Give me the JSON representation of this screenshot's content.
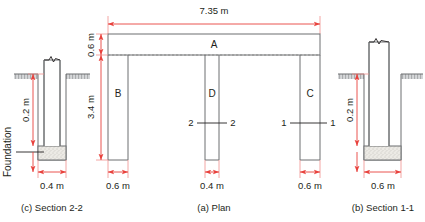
{
  "figure": {
    "colors": {
      "dimension": "#e8413c",
      "outline": "#6d6e71",
      "text": "#231f20",
      "ground_hatch": "#b8babc",
      "footing_fill": "#e9e8e4"
    }
  },
  "plan": {
    "caption": "(a) Plan",
    "overall_span_label": "7.35 m",
    "beam_depth_label": "0.6 m",
    "column_height_label": "3.4 m",
    "members": {
      "beam": "A",
      "column_left": "B",
      "column_middle": "D",
      "column_right": "C"
    },
    "column_widths": [
      {
        "member": "B",
        "label": "0.6 m"
      },
      {
        "member": "D",
        "label": "0.4 m"
      },
      {
        "member": "C",
        "label": "0.6 m"
      }
    ],
    "section_marks": [
      {
        "id": "2",
        "left_label": "2",
        "right_label": "2",
        "on_member": "D"
      },
      {
        "id": "1",
        "left_label": "1",
        "right_label": "1",
        "on_member": "C"
      }
    ]
  },
  "section_1_1": {
    "caption": "(b) Section 1-1",
    "depth_label": "0.2 m",
    "width_label": "0.6 m"
  },
  "section_2_2": {
    "caption": "(c) Section 2-2",
    "depth_label": "0.2 m",
    "width_label": "0.4 m",
    "foundation_label": "Foundation"
  }
}
